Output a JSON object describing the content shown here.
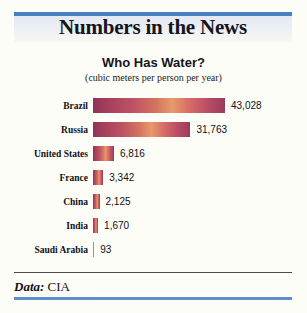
{
  "masthead": {
    "title": "Numbers in the News",
    "rule_color": "#4a7fc1",
    "band_color": "#e3e8f2"
  },
  "footer": {
    "source_label": "Data:",
    "source_value": "CIA",
    "rule_top_color": "#4a4a4a",
    "rule_bottom_color": "#5c8fcc"
  },
  "chart_data": {
    "type": "bar",
    "orientation": "horizontal",
    "title": "Who Has Water?",
    "subtitle": "(cubic meters per person per year)",
    "xlabel": "",
    "ylabel": "",
    "grid": false,
    "legend": "none",
    "xlim": [
      0,
      43028
    ],
    "categories": [
      "Brazil",
      "Russia",
      "United States",
      "France",
      "China",
      "India",
      "Saudi Arabia"
    ],
    "values": [
      43028,
      31763,
      6816,
      3342,
      2125,
      1670,
      93
    ],
    "value_labels": [
      "43,028",
      "31,763",
      "6,816",
      "3,342",
      "2,125",
      "1,670",
      "93"
    ],
    "bar_gradient": [
      "#8d3457",
      "#bd5264",
      "#e79a6a",
      "#bb4f64",
      "#9c3a5c"
    ]
  }
}
